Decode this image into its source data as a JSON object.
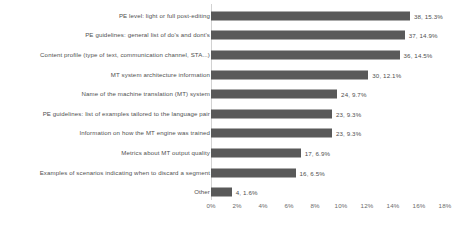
{
  "chart_data": {
    "type": "bar",
    "orientation": "horizontal",
    "title": "",
    "xlabel": "",
    "ylabel": "",
    "xlim": [
      0,
      18
    ],
    "xticks": [
      "0%",
      "2%",
      "4%",
      "6%",
      "8%",
      "10%",
      "12%",
      "14%",
      "16%",
      "18%"
    ],
    "xtick_values": [
      0,
      2,
      4,
      6,
      8,
      10,
      12,
      14,
      16,
      18
    ],
    "grid": false,
    "legend": "none",
    "bar_color": "#595959",
    "axis_color": "#d2d2d2",
    "text_color": "#4f4f4f",
    "categories": [
      "PE level: light or full post-editing",
      "PE guidelines: general list of do's and dont's",
      "Content profile (type of text, communication channel, STA...)",
      "MT system architecture information",
      "Name of the machine translation (MT) system",
      "PE guidelines: list of examples tailored to the language pair",
      "Information on how the MT engine was trained",
      "Metrics about MT output quality",
      "Examples of scenarios indicating when to discard a segment",
      "Other"
    ],
    "values": [
      15.3,
      14.9,
      14.5,
      12.1,
      9.7,
      9.3,
      9.3,
      6.9,
      6.5,
      1.6
    ],
    "counts": [
      38,
      37,
      36,
      30,
      24,
      23,
      23,
      17,
      16,
      4
    ],
    "data_labels": [
      "38, 15.3%",
      "37, 14.9%",
      "36, 14.5%",
      "30, 12.1%",
      "24, 9.7%",
      "23, 9.3%",
      "23, 9.3%",
      "17, 6.9%",
      "16, 6.5%",
      "4, 1.6%"
    ]
  }
}
